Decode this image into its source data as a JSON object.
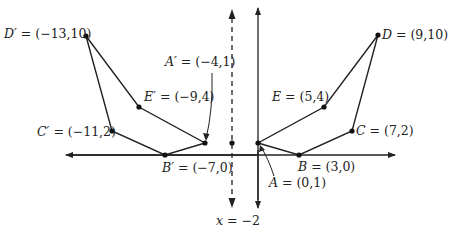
{
  "diagram": {
    "reflection_line": {
      "label": "x = −2",
      "x": -2,
      "style": "dashed"
    },
    "axes": {
      "x_axis": true,
      "y_axis": true,
      "arrows": "both"
    },
    "original": [
      {
        "name": "A",
        "x": 0,
        "y": 1,
        "label": "A = (0,1)"
      },
      {
        "name": "B",
        "x": 3,
        "y": 0,
        "label": "B = (3,0)"
      },
      {
        "name": "C",
        "x": 7,
        "y": 2,
        "label": "C = (7,2)"
      },
      {
        "name": "D",
        "x": 9,
        "y": 10,
        "label": "D = (9,10)"
      },
      {
        "name": "E",
        "x": 5,
        "y": 4,
        "label": "E = (5,4)"
      }
    ],
    "image": [
      {
        "name": "A'",
        "x": -4,
        "y": 1,
        "label": "A′ = (−4,1)"
      },
      {
        "name": "B'",
        "x": -7,
        "y": 0,
        "label": "B′ = (−7,0)"
      },
      {
        "name": "C'",
        "x": -11,
        "y": 2,
        "label": "C′ = (−11,2)"
      },
      {
        "name": "D'",
        "x": -13,
        "y": 10,
        "label": "D′ = (−13,10)"
      },
      {
        "name": "E'",
        "x": -9,
        "y": 4,
        "label": "E′ = (−9,4)"
      }
    ],
    "midpoint_dot": {
      "x": -2,
      "y": 1
    }
  },
  "labels": {
    "A": "A",
    "A_coords": " = (0,1)",
    "B": "B",
    "B_coords": " = (3,0)",
    "C": "C",
    "C_coords": " = (7,2)",
    "D": "D",
    "D_coords": " = (9,10)",
    "E": "E",
    "E_coords": " = (5,4)",
    "Ap": "A′",
    "Ap_coords": " = (−4,1)",
    "Bp": "B′",
    "Bp_coords": " = (−7,0)",
    "Cp": "C′",
    "Cp_coords": " = (−11,2)",
    "Dp": "D′",
    "Dp_coords": " = (−13,10)",
    "Ep": "E′",
    "Ep_coords": " = (−9,4)",
    "line_x": "x",
    "line_eq": " = −2"
  }
}
